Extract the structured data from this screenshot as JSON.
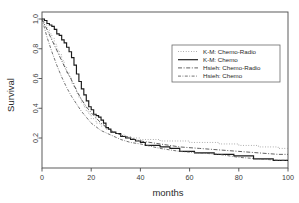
{
  "chart_data": {
    "type": "line",
    "title": "",
    "xlabel": "months",
    "ylabel": "Survival",
    "xlim": [
      0,
      100
    ],
    "ylim": [
      0,
      1.0
    ],
    "xticks": [
      "0",
      "20",
      "40",
      "60",
      "80",
      "100"
    ],
    "xtick_values": [
      0,
      20,
      40,
      60,
      80,
      100
    ],
    "yticks": [
      "0.2",
      "0.4",
      "0.6",
      "0.8",
      "1.0"
    ],
    "ytick_values": [
      0.2,
      0.4,
      0.6,
      0.8,
      1.0
    ],
    "grid": false,
    "legend_position": "upper-right",
    "series": [
      {
        "name": "K-M: Chemo-Radio",
        "style": "dotted",
        "kind": "step",
        "color": "#8a8a8a",
        "x": [
          0,
          1,
          2,
          3,
          4,
          5,
          6,
          7,
          8,
          9,
          10,
          11,
          12,
          13,
          14,
          15,
          16,
          17,
          18,
          19,
          20,
          22,
          24,
          26,
          28,
          30,
          32,
          34,
          36,
          38,
          40,
          44,
          48,
          52,
          56,
          60,
          66,
          72,
          80,
          88,
          96,
          100
        ],
        "y": [
          1.0,
          0.96,
          0.93,
          0.9,
          0.87,
          0.83,
          0.79,
          0.76,
          0.72,
          0.68,
          0.64,
          0.61,
          0.57,
          0.54,
          0.5,
          0.47,
          0.44,
          0.41,
          0.38,
          0.36,
          0.33,
          0.3,
          0.28,
          0.26,
          0.24,
          0.23,
          0.22,
          0.21,
          0.2,
          0.2,
          0.19,
          0.19,
          0.18,
          0.18,
          0.18,
          0.17,
          0.17,
          0.16,
          0.15,
          0.14,
          0.13,
          0.13
        ]
      },
      {
        "name": "K-M: Chemo",
        "style": "solid",
        "kind": "step",
        "color": "#1a1a1a",
        "x": [
          0,
          1,
          2,
          3,
          4,
          5,
          6,
          7,
          8,
          9,
          10,
          11,
          12,
          13,
          14,
          15,
          16,
          17,
          18,
          19,
          20,
          21,
          22,
          23,
          24,
          25,
          26,
          27,
          28,
          30,
          32,
          34,
          36,
          38,
          40,
          42,
          44,
          48,
          52,
          56,
          62,
          70,
          78,
          86,
          94,
          100
        ],
        "y": [
          1.0,
          0.99,
          0.97,
          0.96,
          0.95,
          0.93,
          0.9,
          0.89,
          0.86,
          0.84,
          0.81,
          0.78,
          0.74,
          0.69,
          0.63,
          0.58,
          0.53,
          0.49,
          0.45,
          0.41,
          0.39,
          0.36,
          0.35,
          0.34,
          0.32,
          0.3,
          0.27,
          0.26,
          0.24,
          0.23,
          0.21,
          0.2,
          0.19,
          0.18,
          0.17,
          0.15,
          0.15,
          0.14,
          0.13,
          0.11,
          0.1,
          0.09,
          0.08,
          0.06,
          0.05,
          0.05
        ]
      },
      {
        "name": "Hsieh: Chemo-Radio",
        "style": "dash-dot",
        "kind": "smooth",
        "color": "#444444",
        "x": [
          0,
          2,
          4,
          6,
          8,
          10,
          12,
          14,
          16,
          18,
          20,
          24,
          28,
          32,
          36,
          40,
          48,
          56,
          64,
          72,
          80,
          88,
          96,
          100
        ],
        "y": [
          1.0,
          0.93,
          0.86,
          0.79,
          0.72,
          0.65,
          0.59,
          0.52,
          0.46,
          0.41,
          0.37,
          0.3,
          0.25,
          0.22,
          0.2,
          0.18,
          0.16,
          0.14,
          0.13,
          0.12,
          0.11,
          0.1,
          0.09,
          0.09
        ]
      },
      {
        "name": "Hsieh: Chemo",
        "style": "dash-dot-fine",
        "kind": "smooth",
        "color": "#5a5a5a",
        "x": [
          0,
          2,
          4,
          6,
          8,
          10,
          12,
          14,
          16,
          18,
          20,
          24,
          28,
          32,
          36,
          40,
          48,
          56,
          64,
          72,
          80,
          88,
          96,
          100
        ],
        "y": [
          1.0,
          0.88,
          0.78,
          0.69,
          0.61,
          0.54,
          0.48,
          0.43,
          0.38,
          0.34,
          0.3,
          0.25,
          0.22,
          0.19,
          0.17,
          0.16,
          0.13,
          0.11,
          0.1,
          0.09,
          0.07,
          0.06,
          0.05,
          0.05
        ]
      }
    ]
  },
  "legend": {
    "items": [
      {
        "label": "K-M: Chemo-Radio"
      },
      {
        "label": "K-M: Chemo"
      },
      {
        "label": "Hsieh: Chemo-Radio"
      },
      {
        "label": "Hsieh: Chemo"
      }
    ]
  }
}
